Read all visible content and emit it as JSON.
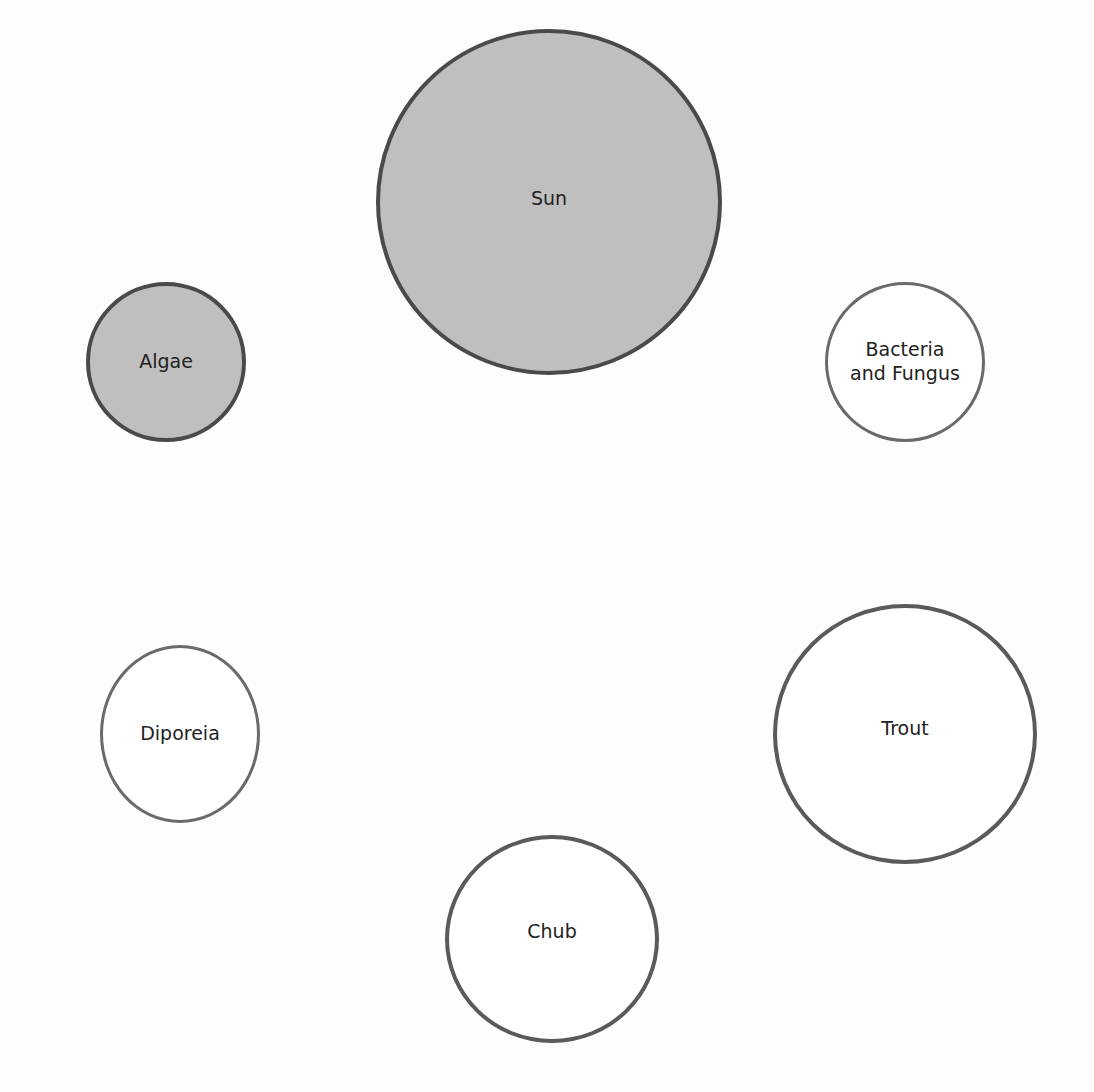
{
  "diagram": {
    "type": "food-web-nodes",
    "nodes": [
      {
        "id": "sun",
        "label": "Sun",
        "style": "filled",
        "fill": "#bfbfbf",
        "cx": 549,
        "cy": 202,
        "r": 173
      },
      {
        "id": "algae",
        "label": "Algae",
        "style": "filled",
        "fill": "#bfbfbf",
        "cx": 166,
        "cy": 362,
        "r": 80
      },
      {
        "id": "bacteria-fungus",
        "label": "Bacteria\nand Fungus",
        "style": "outline",
        "fill": "#ffffff",
        "cx": 905,
        "cy": 362,
        "r": 80
      },
      {
        "id": "diporeia",
        "label": "Diporeia",
        "style": "outline",
        "fill": "#ffffff",
        "cx": 180,
        "cy": 733,
        "r": 80
      },
      {
        "id": "trout",
        "label": "Trout",
        "style": "outline",
        "fill": "#ffffff",
        "cx": 905,
        "cy": 733,
        "r": 132
      },
      {
        "id": "chub",
        "label": "Chub",
        "style": "outline",
        "fill": "#ffffff",
        "cx": 552,
        "cy": 938,
        "r": 107
      }
    ],
    "colors": {
      "filled_node": "#bfbfbf",
      "border": "#4a4a4a",
      "outline_border": "#6a6a6a",
      "text": "#222222",
      "background": "#ffffff"
    }
  }
}
